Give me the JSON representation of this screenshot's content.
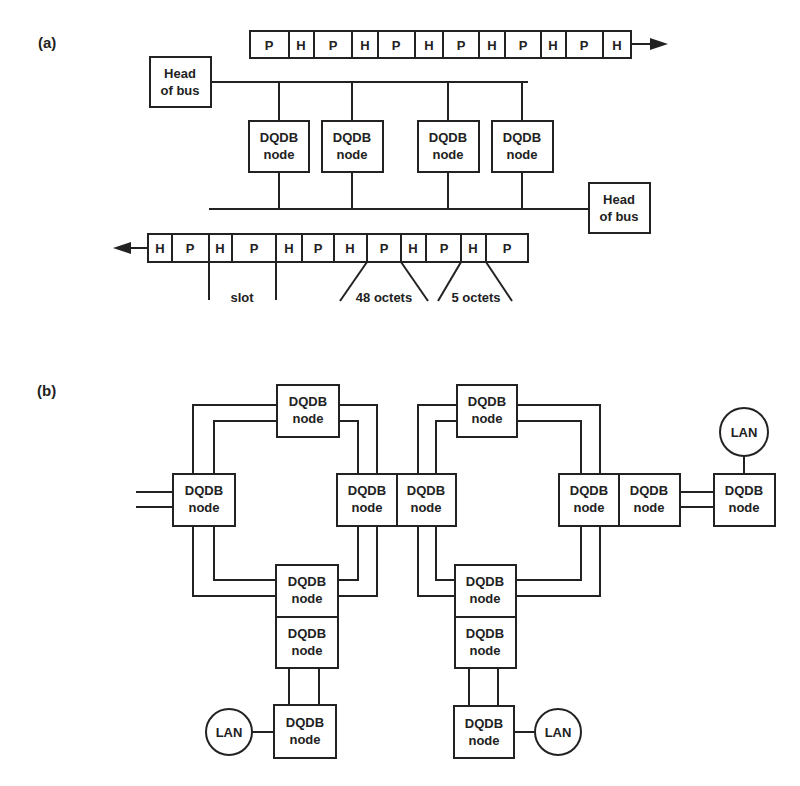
{
  "panel_a": {
    "label": "(a)",
    "head_of_bus_line1": "Head",
    "head_of_bus_line2": "of bus",
    "node_line1": "DQDB",
    "node_line2": "node",
    "top_bus_cells": [
      "P",
      "H",
      "P",
      "H",
      "P",
      "H",
      "P",
      "H",
      "P",
      "H",
      "P",
      "H"
    ],
    "bottom_bus_cells": [
      "H",
      "P",
      "H",
      "P",
      "H",
      "P",
      "H",
      "P",
      "H",
      "P",
      "H",
      "P"
    ],
    "slot_label": "slot",
    "payload_label": "48 octets",
    "header_label": "5 octets"
  },
  "panel_b": {
    "label": "(b)",
    "node_line1": "DQDB",
    "node_line2": "node",
    "lan_label": "LAN"
  }
}
